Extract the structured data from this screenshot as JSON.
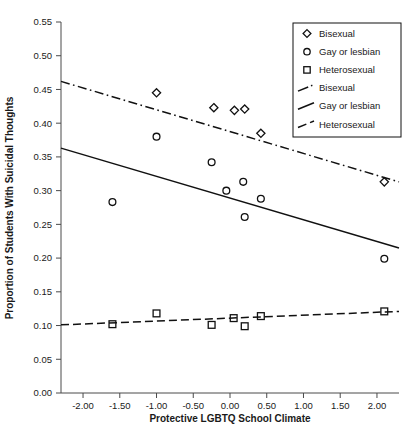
{
  "chart_data": {
    "type": "scatter",
    "title": "",
    "xlabel": "Protective LGBTQ School Climate",
    "ylabel": "Proportion of Students With Suicidal Thoughts",
    "xlim": [
      -2.3,
      2.3
    ],
    "ylim": [
      0.0,
      0.55
    ],
    "grid": false,
    "legend_position": "top-right",
    "xticks": [
      -2.0,
      -1.5,
      -1.0,
      -0.5,
      0.0,
      0.5,
      1.0,
      1.5,
      2.0
    ],
    "xtick_labels": [
      "-2.00",
      "-1.50",
      "-1.00",
      "-0.50",
      "0.00",
      "0.50",
      "1.00",
      "1.50",
      "2.00"
    ],
    "yticks": [
      0.0,
      0.05,
      0.1,
      0.15,
      0.2,
      0.25,
      0.3,
      0.35,
      0.4,
      0.45,
      0.5,
      0.55
    ],
    "ytick_labels": [
      "0.00",
      "0.05",
      "0.10",
      "0.15",
      "0.20",
      "0.25",
      "0.30",
      "0.35",
      "0.40",
      "0.45",
      "0.50",
      "0.55"
    ],
    "series": [
      {
        "name": "Bisexual",
        "marker": "diamond",
        "points": [
          {
            "x": -1.0,
            "y": 0.445
          },
          {
            "x": -0.22,
            "y": 0.423
          },
          {
            "x": 0.06,
            "y": 0.419
          },
          {
            "x": 0.2,
            "y": 0.421
          },
          {
            "x": 0.42,
            "y": 0.385
          },
          {
            "x": 2.1,
            "y": 0.313
          }
        ]
      },
      {
        "name": "Gay or lesbian",
        "marker": "circle",
        "points": [
          {
            "x": -1.6,
            "y": 0.283
          },
          {
            "x": -1.0,
            "y": 0.38
          },
          {
            "x": -0.25,
            "y": 0.342
          },
          {
            "x": -0.05,
            "y": 0.3
          },
          {
            "x": 0.18,
            "y": 0.313
          },
          {
            "x": 0.2,
            "y": 0.261
          },
          {
            "x": 0.42,
            "y": 0.288
          },
          {
            "x": 2.1,
            "y": 0.199
          }
        ]
      },
      {
        "name": "Heterosexual",
        "marker": "square",
        "points": [
          {
            "x": -1.6,
            "y": 0.102
          },
          {
            "x": -1.0,
            "y": 0.118
          },
          {
            "x": -0.25,
            "y": 0.101
          },
          {
            "x": 0.05,
            "y": 0.111
          },
          {
            "x": 0.2,
            "y": 0.099
          },
          {
            "x": 0.42,
            "y": 0.114
          },
          {
            "x": 2.1,
            "y": 0.121
          }
        ]
      }
    ],
    "fit_lines": [
      {
        "name": "Bisexual",
        "style": "dash-dot",
        "x0": -2.3,
        "y0": 0.462,
        "x1": 2.3,
        "y1": 0.313
      },
      {
        "name": "Gay or lesbian",
        "style": "solid",
        "x0": -2.3,
        "y0": 0.363,
        "x1": 2.3,
        "y1": 0.215
      },
      {
        "name": "Heterosexual",
        "style": "dashed",
        "x0": -2.3,
        "y0": 0.101,
        "x1": 2.3,
        "y1": 0.121
      }
    ],
    "legend": [
      {
        "label": "Bisexual",
        "kind": "marker",
        "marker": "diamond"
      },
      {
        "label": "Gay or lesbian",
        "kind": "marker",
        "marker": "circle"
      },
      {
        "label": "Heterosexual",
        "kind": "marker",
        "marker": "square"
      },
      {
        "label": "Bisexual",
        "kind": "line",
        "style": "dash-dot"
      },
      {
        "label": "Gay or lesbian",
        "kind": "line",
        "style": "solid"
      },
      {
        "label": "Heterosexual",
        "kind": "line",
        "style": "dashed"
      }
    ]
  }
}
